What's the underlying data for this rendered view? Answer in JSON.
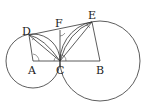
{
  "diagram": {
    "type": "geometry",
    "points": {
      "A": {
        "label": "A",
        "x": 33,
        "y": 61
      },
      "B": {
        "label": "B",
        "x": 100,
        "y": 61
      },
      "C": {
        "label": "C",
        "x": 60,
        "y": 61
      },
      "D": {
        "label": "D",
        "x": 29,
        "y": 35
      },
      "E": {
        "label": "E",
        "x": 92,
        "y": 22
      },
      "F": {
        "label": "F",
        "x": 60,
        "y": 30
      }
    },
    "circles": [
      {
        "name": "circle-A",
        "cx": 33,
        "cy": 61,
        "r": 27
      },
      {
        "name": "circle-B",
        "cx": 100,
        "cy": 61,
        "r": 40
      }
    ],
    "segments": [
      "D-E",
      "A-B",
      "A-D",
      "D-C",
      "C-F",
      "C-E",
      "E-B"
    ],
    "angle_marks": [
      "x at D",
      "x at E",
      "x at C (several)",
      "x at A",
      "x at F"
    ]
  }
}
